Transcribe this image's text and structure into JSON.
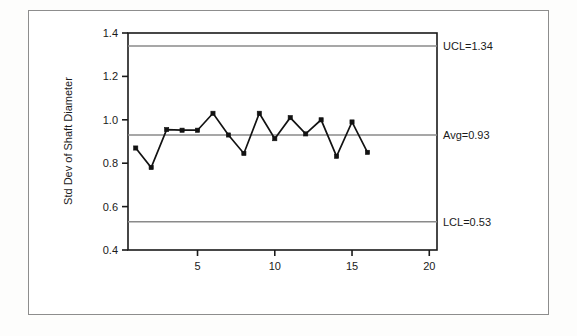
{
  "chart_data": {
    "type": "line",
    "title": "",
    "subtitle": "",
    "xlabel": "",
    "ylabel": "Std Dev of Shaft Diameter",
    "xlim": [
      0.5,
      20.5
    ],
    "ylim": [
      0.4,
      1.4
    ],
    "grid": false,
    "legend_position": "none",
    "x_ticks": [
      5,
      10,
      15,
      20
    ],
    "x_tick_labels": [
      "5",
      "10",
      "15",
      "20"
    ],
    "y_ticks": [
      0.4,
      0.6,
      0.8,
      1.0,
      1.2,
      1.4
    ],
    "y_tick_labels": [
      "0.4",
      "0.6",
      "0.8",
      "1.0",
      "1.2",
      "1.4"
    ],
    "marker": "square",
    "line_color": "#121212",
    "limit_line_color": "#8a8a8a",
    "x": [
      1,
      2,
      3,
      4,
      5,
      6,
      7,
      8,
      9,
      10,
      11,
      12,
      13,
      14,
      15,
      16
    ],
    "values": [
      0.87,
      0.78,
      0.955,
      0.952,
      0.952,
      1.03,
      0.93,
      0.845,
      1.03,
      0.913,
      1.01,
      0.935,
      1.0,
      0.832,
      0.99,
      0.85
    ],
    "series": [
      {
        "name": "Std Dev of Shaft Diameter",
        "values": [
          0.87,
          0.78,
          0.955,
          0.952,
          0.952,
          1.03,
          0.93,
          0.845,
          1.03,
          0.913,
          1.01,
          0.935,
          1.0,
          0.832,
          0.99,
          0.85
        ]
      }
    ],
    "control_limits": [
      {
        "name": "UCL",
        "value": 1.34,
        "label": "UCL=1.34"
      },
      {
        "name": "Avg",
        "value": 0.93,
        "label": "Avg=0.93"
      },
      {
        "name": "LCL",
        "value": 0.53,
        "label": "LCL=0.53"
      }
    ],
    "annotations": [
      {
        "text": "UCL=1.34",
        "at_y": 1.34
      },
      {
        "text": "Avg=0.93",
        "at_y": 0.93
      },
      {
        "text": "LCL=0.53",
        "at_y": 0.53
      }
    ]
  },
  "colors": {
    "axis": "#1a1a1a",
    "data_line": "#121212",
    "limit_line": "#8a8a8a",
    "frame_border": "#8d8d8d",
    "background": "#ffffff"
  }
}
